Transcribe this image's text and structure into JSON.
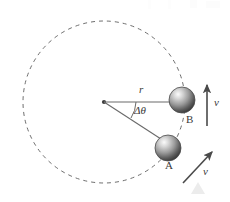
{
  "figure": {
    "type": "physics-diagram",
    "background_color": "#ffffff",
    "stroke_color": "#555555",
    "label_color": "#3a3a3a",
    "labels": {
      "radius": "r",
      "angle": "Δθ",
      "point_a": "A",
      "point_b": "B",
      "velocity_b": "v",
      "velocity_a": "v"
    },
    "geometry": {
      "center": {
        "x": 104,
        "y": 102
      },
      "circle_radius": 81,
      "circle_style": "dashed",
      "ball_b": {
        "x": 182,
        "y": 100,
        "r": 13
      },
      "ball_a": {
        "x": 168,
        "y": 148,
        "r": 13
      },
      "angle_degrees": 33,
      "radius_line_b": {
        "x1": 104,
        "y1": 102,
        "x2": 172,
        "y2": 102
      },
      "radius_line_a": {
        "x1": 104,
        "y1": 102,
        "x2": 160,
        "y2": 140
      },
      "arc": {
        "radius": 32
      },
      "velocity_arrow_b": {
        "x1": 207,
        "y1": 125,
        "x2": 207,
        "y2": 85
      },
      "velocity_arrow_a": {
        "x1": 184,
        "y1": 182,
        "x2": 213,
        "y2": 153
      }
    },
    "colors": {
      "ball_highlight": "#f2f2f2",
      "ball_mid": "#8e8e8e",
      "ball_dark": "#3d3d3d",
      "arrow": "#4a4a4a",
      "dash": "#6e6e6e",
      "watermark": "#ececec"
    },
    "watermark": {
      "present": true,
      "shape": "triangle",
      "x": 198,
      "y": 183
    }
  }
}
